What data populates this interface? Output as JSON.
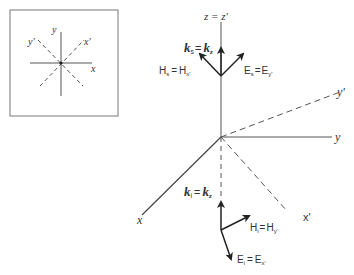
{
  "colors": {
    "line": "#444444",
    "arrow": "#222222",
    "text": "#333333",
    "inset_border": "#777777",
    "background": "#ffffff"
  },
  "inset": {
    "labels": {
      "y": "y",
      "y_prime": "y'",
      "x_prime": "x'",
      "x": "x"
    }
  },
  "axes": {
    "z_label": "z = z'",
    "y_label": "y",
    "y_prime_label": "y'",
    "x_label": "x",
    "x_prime_label": "x'"
  },
  "scattered": {
    "k_label_main": "k",
    "k_label_sub": "s",
    "k_eq": "=",
    "k_rhs_main": "k",
    "k_rhs_sub": "z",
    "H_label_main": "H",
    "H_label_sub": "s",
    "H_eq": "=",
    "H_rhs_main": "H",
    "H_rhs_sub": "x'",
    "E_label_main": "E",
    "E_label_sub": "s",
    "E_eq": "=",
    "E_rhs_main": "E",
    "E_rhs_sub": "y'"
  },
  "incident": {
    "k_label_main": "k",
    "k_label_sub": "i",
    "k_eq": "=",
    "k_rhs_main": "k",
    "k_rhs_sub": "z",
    "H_label_main": "H",
    "H_label_sub": "i",
    "H_eq": "=",
    "H_rhs_main": "H",
    "H_rhs_sub": "y'",
    "E_label_main": "E",
    "E_label_sub": "i",
    "E_eq": "=",
    "E_rhs_main": "E",
    "E_rhs_sub": "x'"
  }
}
